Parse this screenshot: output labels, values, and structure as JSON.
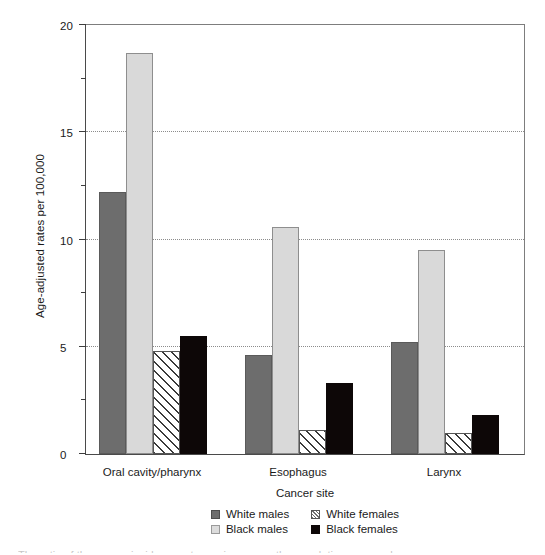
{
  "chart_data": {
    "type": "bar",
    "title": "",
    "subtitle": "",
    "xlabel": "Cancer site",
    "ylabel": "Age-adjusted rates per 100,000",
    "categories": [
      "Oral cavity/pharynx",
      "Esophagus",
      "Larynx"
    ],
    "series": [
      {
        "name": "White males",
        "key": "white-males",
        "color": "#6d6d6d",
        "fill": "solid",
        "values": [
          12.2,
          4.6,
          5.2
        ]
      },
      {
        "name": "Black males",
        "key": "black-males",
        "color": "#d9d9d9",
        "fill": "solid",
        "values": [
          18.7,
          10.6,
          9.5
        ]
      },
      {
        "name": "White females",
        "key": "white-females",
        "color": "#ffffff",
        "fill": "hatch",
        "values": [
          4.8,
          1.1,
          1.0
        ]
      },
      {
        "name": "Black females",
        "key": "black-females",
        "color": "#0d0707",
        "fill": "solid",
        "values": [
          5.5,
          3.3,
          1.8
        ]
      }
    ],
    "plot_order": [
      "white-males",
      "black-males",
      "white-females",
      "black-females"
    ],
    "legend_order": [
      "white-males",
      "white-females",
      "black-males",
      "black-females"
    ],
    "legend_position": "bottom",
    "ylim": [
      0,
      20
    ],
    "yticks": [
      0,
      5,
      10,
      15,
      20
    ],
    "ytick_labels": [
      "0",
      "5",
      "10",
      "15",
      "20"
    ],
    "yminor_ticks": [
      2.5,
      7.5,
      12.5,
      17.5
    ],
    "grid": "horizontal-dotted",
    "gridlines": [
      5,
      10,
      15
    ]
  },
  "axis": {
    "y_title": "Age-adjusted rates per 100,000",
    "x_title": "Cancer site"
  },
  "legend": {
    "items": [
      {
        "label": "White males",
        "swatch": "sw-white-males"
      },
      {
        "label": "White females",
        "swatch": "sw-white-females"
      },
      {
        "label": "Black males",
        "swatch": "sw-black-males"
      },
      {
        "label": "Black females",
        "swatch": "sw-black-females"
      }
    ]
  },
  "caption_sliver": "The ratio of the cancer incidence rates varies across the population groups shown."
}
